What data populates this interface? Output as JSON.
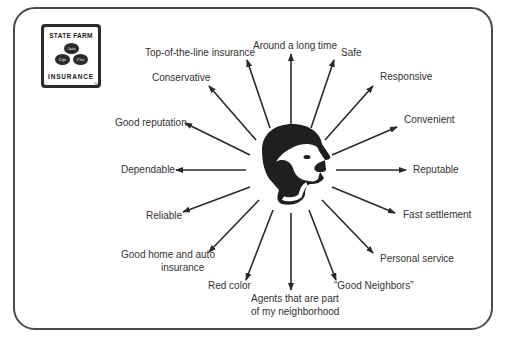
{
  "logo": {
    "top_text": "STATE FARM",
    "bottom_text": "INSURANCE",
    "registered_mark": "®",
    "ovals": [
      "Auto",
      "Life",
      "Fire"
    ]
  },
  "center": {
    "icon": "head-profile-icon"
  },
  "attributes": [
    {
      "id": "top-of-the-line",
      "label": "Top-of-the-line insurance"
    },
    {
      "id": "around-long-time",
      "label": "Around a long time"
    },
    {
      "id": "safe",
      "label": "Safe"
    },
    {
      "id": "conservative",
      "label": "Conservative"
    },
    {
      "id": "responsive",
      "label": "Responsive"
    },
    {
      "id": "convenient",
      "label": "Convenient"
    },
    {
      "id": "good-reputation",
      "label": "Good reputation"
    },
    {
      "id": "dependable",
      "label": "Dependable"
    },
    {
      "id": "reputable",
      "label": "Reputable"
    },
    {
      "id": "reliable",
      "label": "Reliable"
    },
    {
      "id": "fast-settlement",
      "label": "Fast settlement"
    },
    {
      "id": "good-home-auto",
      "label_line1": "Good home and auto",
      "label_line2": "insurance"
    },
    {
      "id": "personal-service",
      "label": "Personal service"
    },
    {
      "id": "red-color",
      "label": "Red color"
    },
    {
      "id": "agents-neighborhood",
      "label_line1": "Agents that are part",
      "label_line2": "of my neighborhood"
    },
    {
      "id": "good-neighbors",
      "label": "“Good Neighbors”"
    }
  ],
  "colors": {
    "ink": "#2a2a2a",
    "text": "#333333",
    "frame": "#4a4a4a"
  }
}
